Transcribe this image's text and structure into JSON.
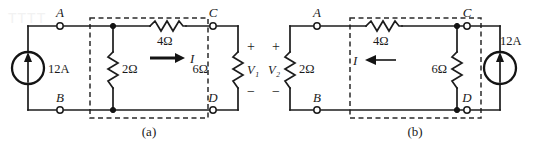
{
  "figure": {
    "watermark_text": "TTTT"
  },
  "circuits": [
    {
      "caption": "(a)",
      "source": {
        "label": "12A",
        "type": "current-source",
        "direction": "up"
      },
      "terminals": [
        {
          "id": "A",
          "label": "A"
        },
        {
          "id": "B",
          "label": "B"
        },
        {
          "id": "C",
          "label": "C"
        },
        {
          "id": "D",
          "label": "D"
        }
      ],
      "resistors": [
        {
          "id": "r2",
          "label": "2Ω",
          "orientation": "vertical"
        },
        {
          "id": "r4",
          "label": "4Ω",
          "orientation": "horizontal"
        },
        {
          "id": "r6",
          "label": "6Ω",
          "orientation": "vertical"
        }
      ],
      "current": {
        "label": "I",
        "direction": "right"
      },
      "voltage": {
        "label": "V₁",
        "plus": "+",
        "minus": "−"
      }
    },
    {
      "caption": "(b)",
      "source": {
        "label": "12A",
        "type": "current-source",
        "direction": "up"
      },
      "terminals": [
        {
          "id": "A",
          "label": "A"
        },
        {
          "id": "B",
          "label": "B"
        },
        {
          "id": "C",
          "label": "C"
        },
        {
          "id": "D",
          "label": "D"
        }
      ],
      "resistors": [
        {
          "id": "r2",
          "label": "2Ω",
          "orientation": "vertical"
        },
        {
          "id": "r4",
          "label": "4Ω",
          "orientation": "horizontal"
        },
        {
          "id": "r6",
          "label": "6Ω",
          "orientation": "vertical"
        }
      ],
      "current": {
        "label": "I",
        "direction": "left"
      },
      "voltage": {
        "label": "V₂",
        "plus": "+",
        "minus": "−"
      }
    }
  ],
  "colors": {
    "wire": "#1c1c1c",
    "dashed_box": "#2a2a2a",
    "text": "#1a1a1a",
    "background": "#ffffff"
  }
}
